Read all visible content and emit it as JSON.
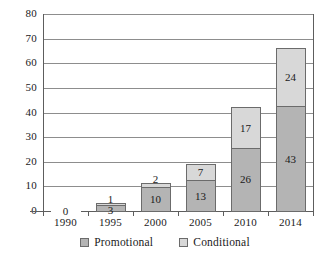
{
  "chart_data": {
    "type": "bar",
    "stacked": true,
    "title": "",
    "subtitle": "",
    "xlabel": "",
    "ylabel": "",
    "categories": [
      "1990",
      "1995",
      "2000",
      "2005",
      "2010",
      "2014"
    ],
    "series": [
      {
        "name": "Promotional",
        "color": "#b4b4b4",
        "values": [
          0,
          3,
          10,
          13,
          26,
          43
        ]
      },
      {
        "name": "Conditional",
        "color": "#d8d8d8",
        "values": [
          0,
          1,
          2,
          7,
          17,
          24
        ]
      }
    ],
    "totals": [
      0,
      4,
      12,
      20,
      43,
      67
    ],
    "ylim": [
      0,
      80
    ],
    "ytick_interval": 10,
    "yticks": [
      "80",
      "70",
      "60",
      "50",
      "40",
      "30",
      "20",
      "10",
      "0"
    ],
    "grid": true,
    "legend_position": "bottom",
    "annotations": [
      {
        "category": "1990",
        "text": "0",
        "note": "zero value marker on baseline"
      }
    ]
  },
  "legend": {
    "items": [
      {
        "label": "Promotional",
        "swatch": "promotional"
      },
      {
        "label": "Conditional",
        "swatch": "conditional"
      }
    ]
  },
  "bars": [
    {
      "category": "1990",
      "promotional": {
        "value": 0,
        "label": ""
      },
      "conditional": {
        "value": 0,
        "label": ""
      },
      "zero_label": "0"
    },
    {
      "category": "1995",
      "promotional": {
        "value": 3,
        "label": "3"
      },
      "conditional": {
        "value": 1,
        "label": "1"
      },
      "zero_label": ""
    },
    {
      "category": "2000",
      "promotional": {
        "value": 10,
        "label": "10"
      },
      "conditional": {
        "value": 2,
        "label": "2"
      },
      "zero_label": ""
    },
    {
      "category": "2005",
      "promotional": {
        "value": 13,
        "label": "13"
      },
      "conditional": {
        "value": 7,
        "label": "7"
      },
      "zero_label": ""
    },
    {
      "category": "2010",
      "promotional": {
        "value": 26,
        "label": "26"
      },
      "conditional": {
        "value": 17,
        "label": "17"
      },
      "zero_label": ""
    },
    {
      "category": "2014",
      "promotional": {
        "value": 43,
        "label": "43"
      },
      "conditional": {
        "value": 24,
        "label": "24"
      },
      "zero_label": ""
    }
  ],
  "colors": {
    "promotional": "#b4b4b4",
    "conditional": "#d8d8d8",
    "gridline": "#8d8d8d",
    "axis": "#5d5d5d",
    "bar_border": "#6b6b6b",
    "text": "#1a1a1a",
    "background": "#ffffff"
  }
}
